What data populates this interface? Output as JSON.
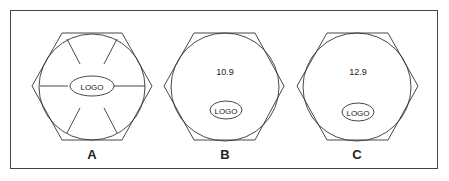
{
  "figures": [
    {
      "label": "A",
      "center_text": "",
      "logo_text": "LOGO"
    },
    {
      "label": "B",
      "center_text": "10.9",
      "logo_text": "LOGO"
    },
    {
      "label": "C",
      "center_text": "12.9",
      "logo_text": "LOGO"
    }
  ],
  "colors": {
    "stroke": "#333333",
    "background": "#ffffff"
  }
}
